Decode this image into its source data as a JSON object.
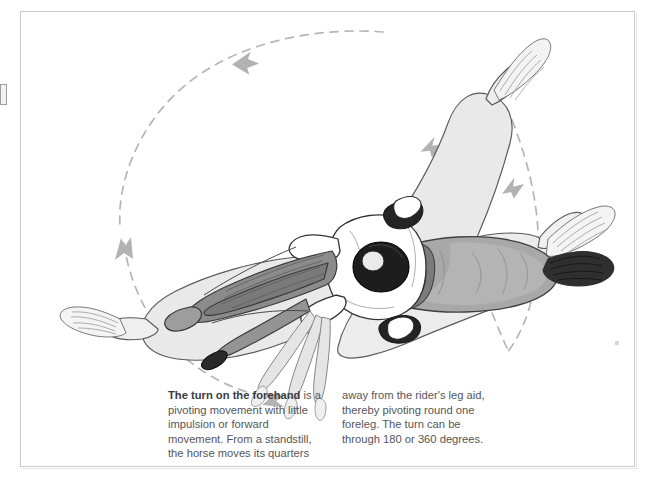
{
  "page": {
    "title": "The turn on the forehand",
    "background_color": "#ffffff",
    "frame_color": "#c9c9c9"
  },
  "illustration": {
    "name": "horse-and-rider-overhead-view",
    "description": "Overhead view of a horse with rider performing a turn on the forehand, shown as overlapping ghosted positions with a dashed circular motion path",
    "colors": {
      "horse_solid": "#a9a9a9",
      "horse_ghost": "#e7e7e7",
      "horse_ghost_2": "#efefef",
      "outline": "#4a4a4a",
      "dash_arc": "#b0b0b0",
      "rider_jacket": "#ffffff",
      "rider_helmet": "#2a2a2a",
      "saddle": "#6e6e6e",
      "boot": "#1f1f1f"
    },
    "motion_path": {
      "style": "dashed-circle",
      "arrow_count": 5,
      "arrow_directions": [
        "left",
        "down",
        "right",
        "up-left",
        "up"
      ]
    }
  },
  "caption": {
    "lead": "The turn on the forehand",
    "column_left": " is a pivoting movement with little impulsion or forward movement. From a standstill, the horse moves its quarters",
    "column_right": "away from the rider's leg aid, thereby pivoting round one foreleg. The turn can be through 180 or 360 degrees."
  }
}
